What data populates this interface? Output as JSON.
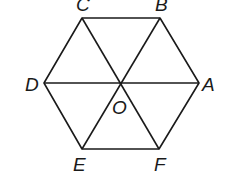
{
  "diagram": {
    "shape": "regular hexagon",
    "center_label": "O",
    "vertices": [
      {
        "label": "A",
        "x": 199,
        "y": 83
      },
      {
        "label": "B",
        "x": 160,
        "y": 18
      },
      {
        "label": "C",
        "x": 82,
        "y": 18
      },
      {
        "label": "D",
        "x": 44,
        "y": 83
      },
      {
        "label": "E",
        "x": 82,
        "y": 149
      },
      {
        "label": "F",
        "x": 159,
        "y": 149
      }
    ],
    "center": {
      "label": "O",
      "x": 121,
      "y": 83
    },
    "segments": [
      "AB",
      "BC",
      "CD",
      "DE",
      "EF",
      "FA",
      "AD",
      "BE",
      "CF"
    ],
    "stroke_color": "#1a1a1a"
  }
}
